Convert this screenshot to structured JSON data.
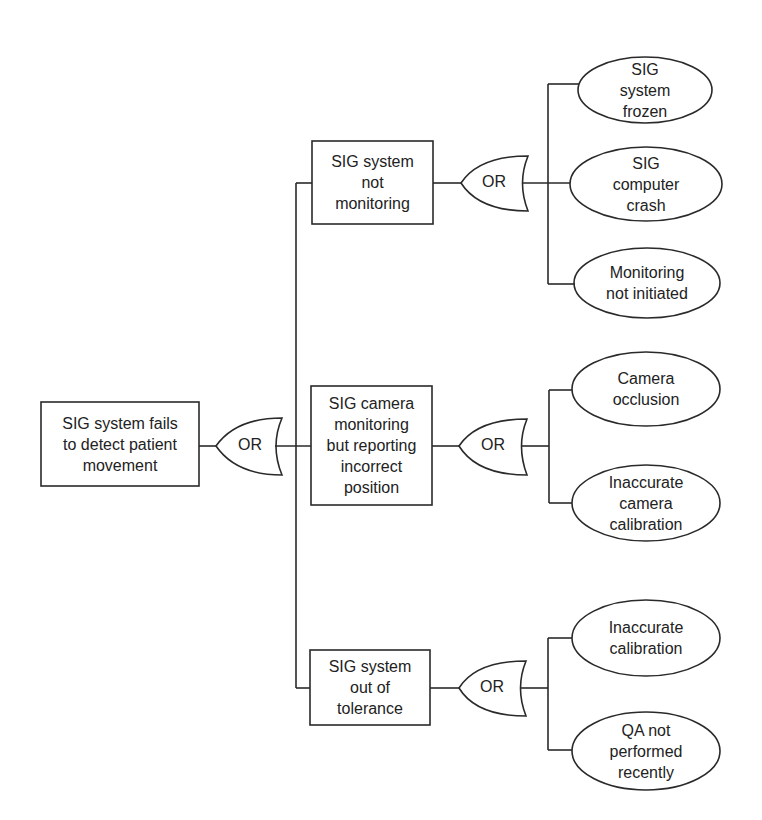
{
  "diagram": {
    "type": "fault-tree",
    "gate_label": "OR",
    "root": {
      "label": "SIG system fails\nto detect patient\nmovement"
    },
    "branches": [
      {
        "label": "SIG system\nnot\nmonitoring",
        "gate": "OR",
        "causes": [
          {
            "label": "SIG\nsystem\nfrozen"
          },
          {
            "label": "SIG\ncomputer\ncrash"
          },
          {
            "label": "Monitoring\nnot initiated"
          }
        ]
      },
      {
        "label": "SIG camera\nmonitoring\nbut reporting\nincorrect\nposition",
        "gate": "OR",
        "causes": [
          {
            "label": "Camera\nocclusion"
          },
          {
            "label": "Inaccurate\ncamera\ncalibration"
          }
        ]
      },
      {
        "label": "SIG system\nout of\ntolerance",
        "gate": "OR",
        "causes": [
          {
            "label": "Inaccurate\ncalibration"
          },
          {
            "label": "QA not\nperformed\nrecently"
          }
        ]
      }
    ],
    "colors": {
      "stroke": "#222222",
      "background": "#ffffff",
      "text": "#222222"
    }
  }
}
